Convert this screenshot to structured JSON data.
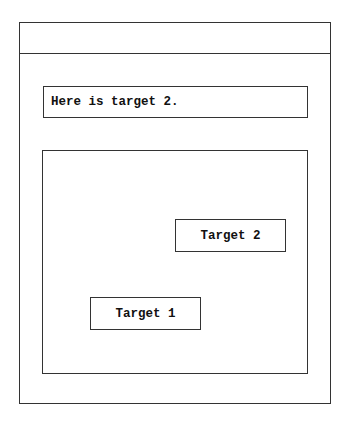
{
  "query": {
    "text": "Here is target 2."
  },
  "canvas": {
    "targets": [
      {
        "label": "Target 2"
      },
      {
        "label": "Target 1"
      }
    ]
  }
}
